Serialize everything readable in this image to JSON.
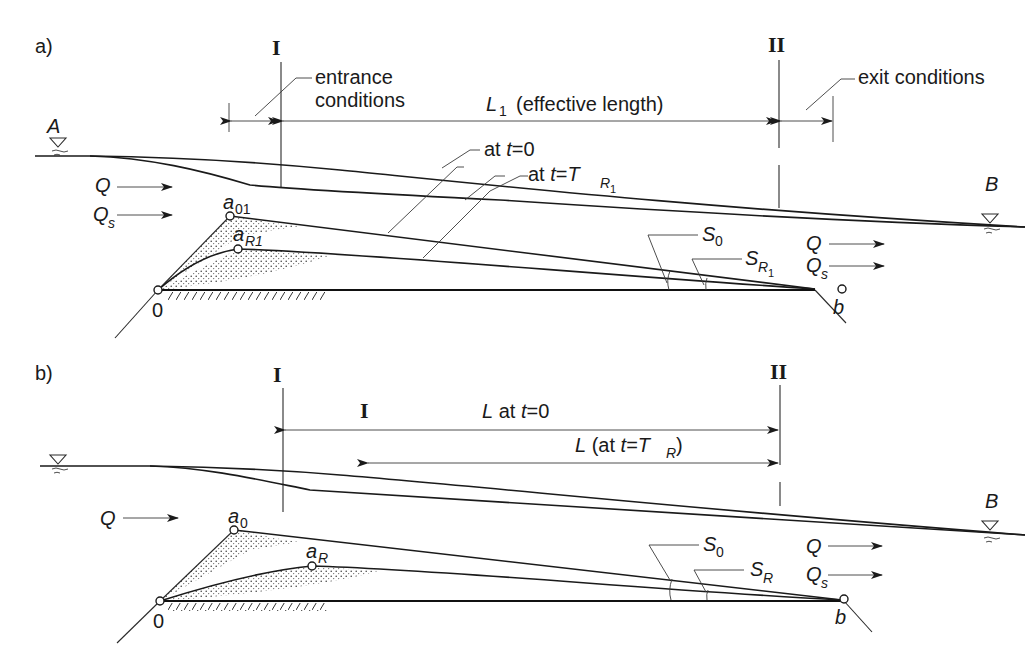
{
  "figure": {
    "panel_a": {
      "label": "a)",
      "section_I": "I",
      "section_II": "II",
      "entrance_conditions_line1": "entrance",
      "entrance_conditions_line2": "conditions",
      "exit_conditions": "exit conditions",
      "length_symbol": "L",
      "length_subscript": "1",
      "length_text": "(effective length)",
      "point_A": "A",
      "point_B": "B",
      "flow_Q": "Q",
      "flow_Qs": "Q",
      "flow_Qs_sub": "s",
      "node_a01": "a",
      "node_a01_sub": "01",
      "node_aR1": "a",
      "node_aR1_sub": "R1",
      "node_0": "0",
      "node_b": "b",
      "slope_S0": "S",
      "slope_S0_sub": "0",
      "slope_SR1": "S",
      "slope_SR1_sub": "R",
      "slope_SR1_subsub": "1",
      "time_t0": "at t=0",
      "time_t0_prefix": "at ",
      "time_t0_var": "t",
      "time_t0_eq": "=0",
      "time_tR1_prefix": "at ",
      "time_tR1_var": "t",
      "time_tR1_eq": "=",
      "time_tR1_T": "T",
      "time_tR1_sub": "R",
      "time_tR1_subsub": "1"
    },
    "panel_b": {
      "label": "b)",
      "section_I": "I",
      "section_I_inner": "I",
      "section_II": "II",
      "length_L_t0_var": "L",
      "length_L_t0_text": " at ",
      "length_L_t0_t": "t",
      "length_L_t0_eq": "=0",
      "length_L_tR_var": "L",
      "length_L_tR_text": " (at ",
      "length_L_tR_t": "t",
      "length_L_tR_eq": "=",
      "length_L_tR_T": "T",
      "length_L_tR_sub": "R",
      "length_L_tR_close": ")",
      "point_B": "B",
      "flow_Q_left": "Q",
      "flow_Q_right": "Q",
      "flow_Qs": "Q",
      "flow_Qs_sub": "s",
      "node_a0": "a",
      "node_a0_sub": "0",
      "node_aR": "a",
      "node_aR_sub": "R",
      "node_0": "0",
      "node_b": "b",
      "slope_S0": "S",
      "slope_S0_sub": "0",
      "slope_SR": "S",
      "slope_SR_sub": "R"
    }
  }
}
